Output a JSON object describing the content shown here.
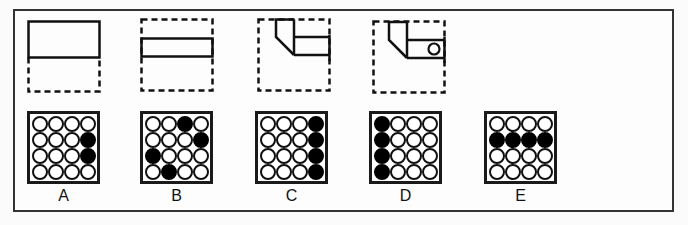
{
  "puzzle": {
    "sequence": [
      {
        "id": "fig-1",
        "description": "solid rectangle on top half of dashed square"
      },
      {
        "id": "fig-2",
        "description": "solid horizontal bar across dashed square"
      },
      {
        "id": "fig-3",
        "description": "L-shaped polygon with bar to right edge in dashed square"
      },
      {
        "id": "fig-4",
        "description": "L-shaped polygon with bar and small circle in dashed square"
      }
    ],
    "options": [
      {
        "label": "A",
        "filled": [
          [
            0,
            0,
            0,
            0
          ],
          [
            0,
            0,
            0,
            1
          ],
          [
            0,
            0,
            0,
            1
          ],
          [
            0,
            0,
            0,
            0
          ]
        ]
      },
      {
        "label": "B",
        "filled": [
          [
            0,
            0,
            1,
            0
          ],
          [
            0,
            0,
            0,
            1
          ],
          [
            1,
            0,
            0,
            0
          ],
          [
            0,
            1,
            0,
            0
          ]
        ]
      },
      {
        "label": "C",
        "filled": [
          [
            0,
            0,
            0,
            1
          ],
          [
            0,
            0,
            0,
            1
          ],
          [
            0,
            0,
            0,
            1
          ],
          [
            0,
            0,
            0,
            1
          ]
        ]
      },
      {
        "label": "D",
        "filled": [
          [
            1,
            0,
            0,
            0
          ],
          [
            1,
            0,
            0,
            0
          ],
          [
            1,
            0,
            0,
            0
          ],
          [
            1,
            0,
            0,
            0
          ]
        ]
      },
      {
        "label": "E",
        "filled": [
          [
            0,
            0,
            0,
            0
          ],
          [
            1,
            1,
            1,
            1
          ],
          [
            0,
            0,
            0,
            0
          ],
          [
            0,
            0,
            0,
            0
          ]
        ]
      }
    ]
  },
  "colors": {
    "stroke": "#111111",
    "frame": "#333333",
    "filled_dot": "#000000",
    "empty_dot": "#ffffff"
  }
}
